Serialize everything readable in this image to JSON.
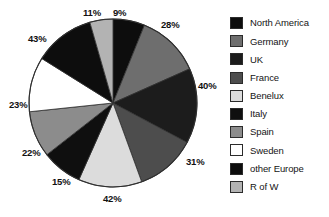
{
  "chart_data": {
    "type": "pie",
    "title": "",
    "subtitle": "",
    "xlabel": "",
    "ylabel": "",
    "legend_position": "right",
    "grid": false,
    "start_angle_deg": 0,
    "direction": "clockwise",
    "categories": [
      "North America",
      "Germany",
      "UK",
      "France",
      "Benelux",
      "Italy",
      "Spain",
      "Sweden",
      "other Europe",
      "R of W"
    ],
    "labels": [
      "9%",
      "28%",
      "40%",
      "31%",
      "42%",
      "15%",
      "22%",
      "23%",
      "43%",
      "11%"
    ],
    "values": [
      9,
      28,
      40,
      31,
      42,
      15,
      22,
      23,
      43,
      11
    ],
    "slice_angles_deg": [
      22,
      44,
      52,
      42,
      44,
      28,
      32,
      38,
      42,
      16
    ],
    "colors": [
      "#0d0d0d",
      "#6e6e6e",
      "#1c1c1c",
      "#4d4d4d",
      "#dcdcdc",
      "#0f0f0f",
      "#8c8c8c",
      "#ffffff",
      "#0d0d0d",
      "#b3b3b3"
    ],
    "slices": [
      {
        "name": "North America",
        "label": "9%",
        "value": 9,
        "color": "#0d0d0d"
      },
      {
        "name": "Germany",
        "label": "28%",
        "value": 28,
        "color": "#6e6e6e"
      },
      {
        "name": "UK",
        "label": "40%",
        "value": 40,
        "color": "#1c1c1c"
      },
      {
        "name": "France",
        "label": "31%",
        "value": 31,
        "color": "#4d4d4d"
      },
      {
        "name": "Benelux",
        "label": "42%",
        "value": 42,
        "color": "#dcdcdc"
      },
      {
        "name": "Italy",
        "label": "15%",
        "value": 15,
        "color": "#0f0f0f"
      },
      {
        "name": "Spain",
        "label": "22%",
        "value": 22,
        "color": "#8c8c8c"
      },
      {
        "name": "Sweden",
        "label": "23%",
        "value": 23,
        "color": "#ffffff"
      },
      {
        "name": "other Europe",
        "label": "43%",
        "value": 43,
        "color": "#0d0d0d"
      },
      {
        "name": "R of W",
        "label": "11%",
        "value": 11,
        "color": "#b3b3b3"
      }
    ]
  },
  "legend": {
    "items": [
      {
        "label": "North America",
        "color": "#0d0d0d"
      },
      {
        "label": "Germany",
        "color": "#6e6e6e"
      },
      {
        "label": "UK",
        "color": "#1c1c1c"
      },
      {
        "label": "France",
        "color": "#4d4d4d"
      },
      {
        "label": "Benelux",
        "color": "#dcdcdc"
      },
      {
        "label": "Italy",
        "color": "#0f0f0f"
      },
      {
        "label": "Spain",
        "color": "#8c8c8c"
      },
      {
        "label": "Sweden",
        "color": "#ffffff"
      },
      {
        "label": "other Europe",
        "color": "#0d0d0d"
      },
      {
        "label": "R of W",
        "color": "#b3b3b3"
      }
    ]
  },
  "slice_label_positions": [
    {
      "label": "9%",
      "left": 113,
      "top": 8
    },
    {
      "label": "28%",
      "left": 161,
      "top": 20
    },
    {
      "label": "40%",
      "left": 198,
      "top": 81
    },
    {
      "label": "31%",
      "left": 186,
      "top": 157
    },
    {
      "label": "42%",
      "left": 103,
      "top": 194
    },
    {
      "label": "15%",
      "left": 52,
      "top": 177
    },
    {
      "label": "22%",
      "left": 22,
      "top": 148
    },
    {
      "label": "23%",
      "left": 9,
      "top": 100
    },
    {
      "label": "43%",
      "left": 28,
      "top": 34
    },
    {
      "label": "11%",
      "left": 83,
      "top": 8
    }
  ]
}
